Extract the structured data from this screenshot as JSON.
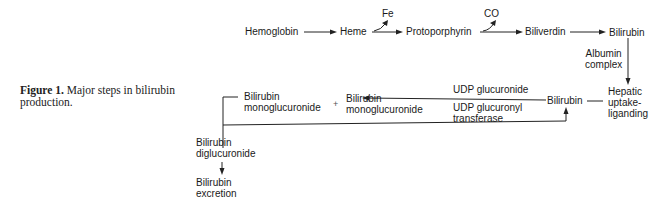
{
  "caption": {
    "label": "Figure 1.",
    "text": "Major steps in bilirubin production."
  },
  "nodes": {
    "hemoglobin": "Hemoglobin",
    "heme": "Heme",
    "fe": "Fe",
    "protoporphyrin": "Protoporphyrin",
    "co": "CO",
    "biliverdin": "Biliverdin",
    "bilirubin_top": "Bilirubin",
    "albumin_line1": "Albumin",
    "albumin_line2": "complex",
    "hepatic_line1": "Hepatic",
    "hepatic_line2": "uptake-",
    "hepatic_line3": "liganding",
    "bilirubin_mid": "Bilirubin",
    "udp_glucuronide": "UDP glucuronide",
    "udp_transferase_line1": "UDP glucuronyl",
    "udp_transferase_line2": "transferase",
    "monoglucuronide_right_line1": "Bilirubin",
    "monoglucuronide_right_line2": "monoglucuronide",
    "plus": "+",
    "monoglucuronide_left_line1": "Bilirubin",
    "monoglucuronide_left_line2": "monoglucuronide",
    "diglucuronide_line1": "Bilirubin",
    "diglucuronide_line2": "diglucuronide",
    "excretion_line1": "Bilirubin",
    "excretion_line2": "excretion"
  },
  "edges": [
    {
      "from": "Hemoglobin",
      "to": "Heme"
    },
    {
      "from": "Heme",
      "to": "Protoporphyrin",
      "byproduct": "Fe"
    },
    {
      "from": "Protoporphyrin",
      "to": "Biliverdin",
      "byproduct": "CO"
    },
    {
      "from": "Biliverdin",
      "to": "Bilirubin"
    },
    {
      "from": "Bilirubin",
      "to": "Hepatic uptake-liganding",
      "label": "Albumin complex"
    },
    {
      "from": "Hepatic uptake-liganding",
      "to": "Bilirubin"
    },
    {
      "from": "Bilirubin",
      "to": "Bilirubin monoglucuronide",
      "label": "UDP glucuronide / UDP glucuronyl transferase"
    },
    {
      "from": "Bilirubin monoglucuronide",
      "to": "Bilirubin diglucuronide"
    },
    {
      "from": "Bilirubin diglucuronide",
      "to": "Bilirubin",
      "kind": "loop-back"
    },
    {
      "from": "Bilirubin diglucuronide",
      "to": "Bilirubin excretion"
    }
  ]
}
